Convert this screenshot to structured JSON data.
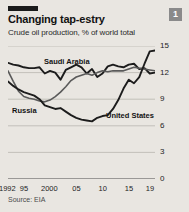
{
  "badge": "1",
  "title": "Changing tap-estry",
  "subtitle": "Crude oil production, % of world total",
  "source": "Source: EIA",
  "colors": {
    "background": "#e9e6e1",
    "rule": "#1a1a1a",
    "badge": "#8a8a8a",
    "saudi": "#1c1c1c",
    "russia": "#5a5a5a",
    "united_states": "#1c1c1c",
    "grid": "#b9b6b0"
  },
  "axis": {
    "y_ticks": [
      "0",
      "3",
      "6",
      "9",
      "12",
      "15"
    ],
    "x_ticks": [
      "1992",
      "95",
      "2000",
      "05",
      "10",
      "15",
      "19"
    ]
  },
  "chart_data": {
    "type": "line",
    "title": "Changing tap-estry",
    "subtitle": "Crude oil production, % of world total",
    "xlabel": "",
    "ylabel": "% of world total",
    "xlim": [
      1992,
      2020
    ],
    "ylim": [
      0,
      15
    ],
    "grid": true,
    "legend": "inline-labels",
    "source": "Source: EIA",
    "x": [
      1992,
      1993,
      1994,
      1995,
      1996,
      1997,
      1998,
      1999,
      2000,
      2001,
      2002,
      2003,
      2004,
      2005,
      2006,
      2007,
      2008,
      2009,
      2010,
      2011,
      2012,
      2013,
      2014,
      2015,
      2016,
      2017,
      2018,
      2019,
      2020
    ],
    "series": [
      {
        "name": "Saudi Arabia",
        "color": "#1c1c1c",
        "values": [
          13.1,
          12.9,
          12.8,
          12.6,
          12.5,
          12.5,
          12.6,
          11.9,
          12.2,
          12.0,
          11.2,
          12.3,
          12.6,
          12.9,
          12.6,
          11.9,
          12.4,
          11.5,
          11.9,
          12.7,
          12.9,
          12.7,
          12.6,
          12.9,
          13.0,
          12.4,
          12.5,
          11.9,
          12.0
        ]
      },
      {
        "name": "Russia",
        "color": "#5a5a5a",
        "values": [
          12.2,
          11.0,
          9.9,
          9.3,
          9.1,
          9.0,
          8.8,
          8.7,
          8.9,
          9.3,
          9.8,
          10.4,
          11.1,
          11.5,
          11.7,
          11.9,
          11.7,
          12.0,
          12.2,
          12.1,
          12.2,
          12.2,
          12.2,
          12.4,
          12.6,
          12.5,
          12.4,
          12.3,
          12.2
        ]
      },
      {
        "name": "United States",
        "color": "#1c1c1c",
        "values": [
          11.0,
          10.5,
          10.1,
          9.8,
          9.6,
          9.4,
          9.0,
          8.3,
          8.1,
          7.9,
          8.0,
          7.6,
          7.2,
          6.9,
          6.7,
          6.6,
          6.5,
          6.9,
          7.1,
          7.2,
          7.9,
          8.9,
          10.2,
          11.2,
          10.8,
          11.5,
          13.0,
          14.4,
          14.5
        ]
      }
    ]
  }
}
